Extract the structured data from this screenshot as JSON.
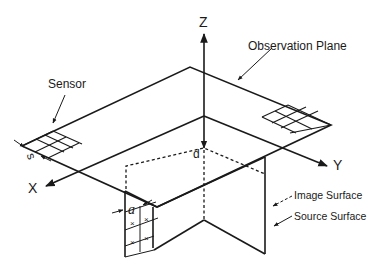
{
  "diagram": {
    "type": "3D geometry schematic",
    "labels": {
      "z_axis": "Z",
      "x_axis": "X",
      "y_axis": "Y",
      "observation_plane": "Observation Plane",
      "sensor": "Sensor",
      "sensor_spacing": "s",
      "distance": "d",
      "source_pixel": "a",
      "image_surface": "Image Surface",
      "source_surface": "Source Surface",
      "source_marker": "×"
    },
    "colors": {
      "line": "#1a1a1a",
      "background": "#ffffff"
    }
  }
}
